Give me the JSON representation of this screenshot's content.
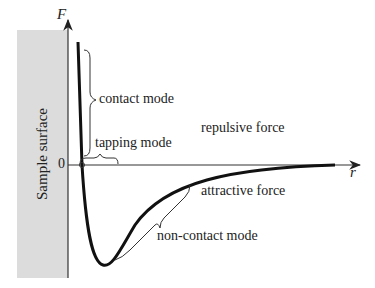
{
  "diagram": {
    "panel_label": "Sample surface",
    "axes": {
      "y_label": "F",
      "x_label": "r",
      "origin_label": "0"
    },
    "annotations": {
      "contact": "contact mode",
      "tapping": "tapping mode",
      "noncontact": "non-contact mode",
      "repulsive": "repulsive force",
      "attractive": "attractive force"
    }
  }
}
